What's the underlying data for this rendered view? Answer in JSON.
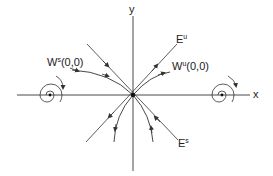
{
  "figure": {
    "colors": {
      "stroke": "#333333",
      "background": "#ffffff"
    },
    "axes": {
      "x_label": "x",
      "y_label": "y"
    },
    "labels": {
      "unstable_eigenspace": {
        "base": "E",
        "sup": "u"
      },
      "stable_eigenspace": {
        "base": "E",
        "sup": "s"
      },
      "unstable_manifold": {
        "base": "W",
        "sup": "u",
        "arg": "(0,0)"
      },
      "stable_manifold": {
        "base": "W",
        "sup": "s",
        "arg": "(0,0)"
      }
    },
    "equilibria": [
      {
        "name": "saddle",
        "position": "origin"
      },
      {
        "name": "left-spiral",
        "position": "negative x-axis",
        "rotation": "clockwise"
      },
      {
        "name": "right-spiral",
        "position": "positive x-axis",
        "rotation": "clockwise"
      }
    ]
  }
}
